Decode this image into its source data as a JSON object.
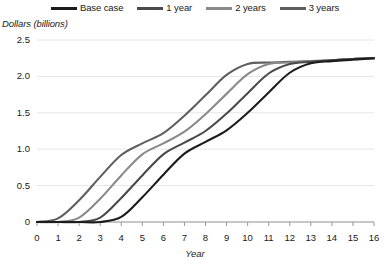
{
  "legend": {
    "position": "top-center",
    "items": [
      {
        "label": "Base case",
        "color": "#1c1c1c"
      },
      {
        "label": "1 year",
        "color": "#4a4a4a"
      },
      {
        "label": "2 years",
        "color": "#8a8a8a"
      },
      {
        "label": "3 years",
        "color": "#5f5f5f"
      }
    ]
  },
  "axes": {
    "ytitle": "Dollars (billions)",
    "xtitle": "Year",
    "yticks": [
      "0",
      "0.5",
      "1.0",
      "1.5",
      "2.0",
      "2.5"
    ],
    "xticks": [
      "0",
      "1",
      "2",
      "3",
      "4",
      "5",
      "6",
      "7",
      "8",
      "9",
      "10",
      "11",
      "12",
      "13",
      "14",
      "15",
      "16"
    ]
  },
  "footnote": "",
  "chart_data": {
    "type": "line",
    "title": "",
    "subtitle": "",
    "xlabel": "Year",
    "ylabel": "Dollars (billions)",
    "xlim": [
      0,
      16
    ],
    "ylim": [
      0,
      2.5
    ],
    "yticks": [
      0,
      0.5,
      1.0,
      1.5,
      2.0,
      2.5
    ],
    "xticks": [
      0,
      1,
      2,
      3,
      4,
      5,
      6,
      7,
      8,
      9,
      10,
      11,
      12,
      13,
      14,
      15,
      16
    ],
    "grid": "horizontal",
    "legend_position": "top-center",
    "x": [
      0,
      1,
      2,
      3,
      4,
      5,
      6,
      7,
      8,
      9,
      10,
      11,
      12,
      13,
      14,
      15,
      16
    ],
    "series": [
      {
        "name": "Base case",
        "color": "#5f5f5f",
        "values": [
          0.0,
          0.05,
          0.3,
          0.62,
          0.92,
          1.08,
          1.22,
          1.46,
          1.74,
          2.02,
          2.17,
          2.19,
          2.2,
          2.21,
          2.22,
          2.24,
          2.25
        ]
      },
      {
        "name": "1 year",
        "color": "#8a8a8a",
        "values": [
          0.0,
          0.0,
          0.06,
          0.32,
          0.64,
          0.93,
          1.08,
          1.24,
          1.48,
          1.76,
          2.03,
          2.17,
          2.19,
          2.21,
          2.22,
          2.24,
          2.25
        ]
      },
      {
        "name": "2 years",
        "color": "#4a4a4a",
        "values": [
          0.0,
          0.0,
          0.0,
          0.06,
          0.33,
          0.64,
          0.93,
          1.09,
          1.25,
          1.49,
          1.77,
          2.04,
          2.17,
          2.2,
          2.22,
          2.24,
          2.25
        ]
      },
      {
        "name": "3 years",
        "color": "#1c1c1c",
        "values": [
          0.0,
          0.0,
          0.0,
          0.0,
          0.07,
          0.34,
          0.65,
          0.94,
          1.1,
          1.26,
          1.5,
          1.78,
          2.05,
          2.18,
          2.21,
          2.23,
          2.25
        ]
      }
    ]
  }
}
